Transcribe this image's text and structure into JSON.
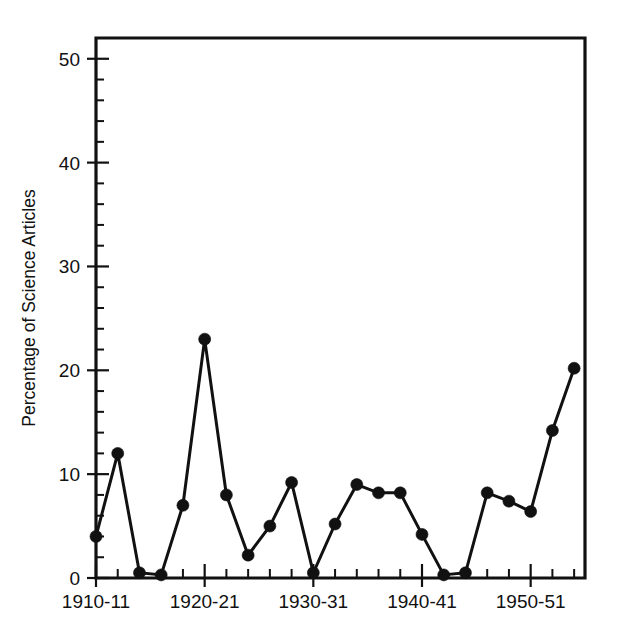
{
  "chart_data": {
    "type": "line",
    "title": "",
    "subtitle": "",
    "xlabel": "",
    "ylabel": "Percentage of Science Articles",
    "ylim": [
      0,
      52
    ],
    "xlim": [
      1910,
      1955
    ],
    "grid": false,
    "legend": null,
    "y_ticks_major": [
      0,
      10,
      20,
      30,
      40,
      50
    ],
    "y_tick_labels": [
      "0",
      "10",
      "20",
      "30",
      "40",
      "50"
    ],
    "y_tick_minor_step": 2,
    "x_ticks_major": [
      1910,
      1920,
      1930,
      1940,
      1950
    ],
    "x_tick_labels": [
      "1910-11",
      "1920-21",
      "1930-31",
      "1940-41",
      "1950-51"
    ],
    "x_tick_minor_step": 2,
    "marker": "filled-circle",
    "line_color": "#111111",
    "marker_color": "#111111",
    "x": [
      1910,
      1912,
      1914,
      1916,
      1918,
      1920,
      1922,
      1924,
      1926,
      1928,
      1930,
      1932,
      1934,
      1936,
      1938,
      1940,
      1942,
      1944,
      1946,
      1948,
      1950,
      1952,
      1954
    ],
    "x_period_labels": [
      "1910-11",
      "1912-13",
      "1914-15",
      "1916-17",
      "1918-19",
      "1920-21",
      "1922-23",
      "1924-25",
      "1926-27",
      "1928-29",
      "1930-31",
      "1932-33",
      "1934-35",
      "1936-37",
      "1938-39",
      "1940-41",
      "1942-43",
      "1944-45",
      "1946-47",
      "1948-49",
      "1950-51",
      "1952-53",
      "1954-55"
    ],
    "values": [
      4.0,
      12.0,
      0.5,
      0.3,
      7.0,
      23.0,
      8.0,
      2.2,
      5.0,
      9.2,
      0.5,
      5.2,
      9.0,
      8.2,
      8.2,
      4.2,
      0.3,
      0.5,
      8.2,
      7.4,
      6.4,
      14.2,
      20.2
    ],
    "series": [
      {
        "name": "Percentage of Science Articles",
        "values": [
          4.0,
          12.0,
          0.5,
          0.3,
          7.0,
          23.0,
          8.0,
          2.2,
          5.0,
          9.2,
          0.5,
          5.2,
          9.0,
          8.2,
          8.2,
          4.2,
          0.3,
          0.5,
          8.2,
          7.4,
          6.4,
          14.2,
          20.2
        ]
      }
    ]
  },
  "figure": {
    "background": "#ffffff",
    "frame_color": "#111111"
  }
}
